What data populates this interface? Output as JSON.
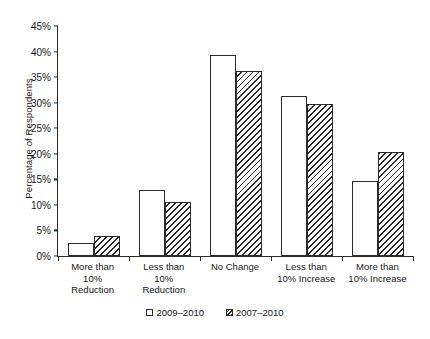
{
  "chart_data": {
    "type": "bar",
    "title": "",
    "xlabel": "",
    "ylabel": "Percentage of Respondents",
    "ylim": [
      0,
      45
    ],
    "ytick_labels": [
      "0%",
      "5%",
      "10%",
      "15%",
      "20%",
      "25%",
      "30%",
      "35%",
      "40%",
      "45%"
    ],
    "ytick_values": [
      0,
      5,
      10,
      15,
      20,
      25,
      30,
      35,
      40,
      45
    ],
    "grid": false,
    "legend_position": "bottom-center",
    "categories": [
      "More than\n10%\nReduction",
      "Less than\n10%\nReduction",
      "No Change",
      "Less than\n10% Increase",
      "More than\n10% Increase"
    ],
    "series": [
      {
        "name": "2009–2010",
        "style": "open",
        "values": [
          2.5,
          13.0,
          39.4,
          31.3,
          14.6
        ]
      },
      {
        "name": "2007–2010",
        "style": "hatched",
        "values": [
          4.0,
          10.5,
          36.2,
          29.7,
          20.3
        ]
      }
    ]
  },
  "legend": {
    "items": [
      {
        "label": "2009–2010",
        "style": "open"
      },
      {
        "label": "2007–2010",
        "style": "hatched"
      }
    ]
  }
}
